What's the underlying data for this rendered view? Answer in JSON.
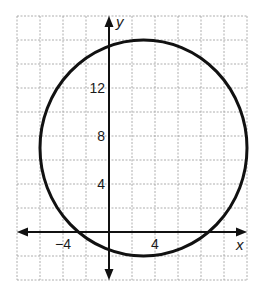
{
  "chart_data": {
    "type": "line",
    "title": "",
    "xlabel": "x",
    "ylabel": "y",
    "xlim": [
      -8,
      12
    ],
    "ylim": [
      -4,
      18
    ],
    "grid": true,
    "grid_step": 2,
    "x_tick_labels": [
      {
        "value": -4,
        "label": "−4"
      },
      {
        "value": 4,
        "label": "4"
      }
    ],
    "y_tick_labels": [
      {
        "value": 4,
        "label": "4"
      },
      {
        "value": 8,
        "label": "8"
      },
      {
        "value": 12,
        "label": "12"
      }
    ],
    "series": [
      {
        "name": "circle",
        "shape": "circle",
        "center": [
          3,
          7
        ],
        "radius": 9,
        "color": "#111111"
      }
    ],
    "legend": null
  },
  "colors": {
    "grid": "#9a9a9a",
    "axis": "#111111",
    "curve": "#111111"
  }
}
